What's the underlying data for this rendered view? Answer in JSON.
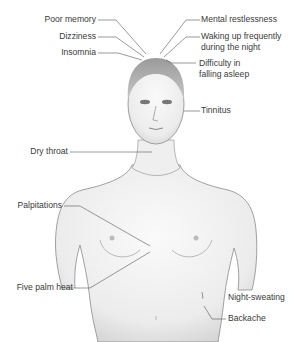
{
  "diagram": {
    "labels_left": [
      {
        "id": "poor-memory",
        "text": "Poor memory"
      },
      {
        "id": "dizziness",
        "text": "Dizziness"
      },
      {
        "id": "insomnia",
        "text": "Insomnia"
      },
      {
        "id": "dry-throat",
        "text": "Dry throat"
      },
      {
        "id": "palpitations",
        "text": "Palpitations"
      },
      {
        "id": "five-palm-heat",
        "text": "Five palm heat"
      }
    ],
    "labels_right": [
      {
        "id": "mental-restlessness",
        "text": "Mental restlessness"
      },
      {
        "id": "waking-up",
        "line1": "Waking up frequently",
        "line2": "during the night"
      },
      {
        "id": "difficulty-asleep",
        "line1": "Difficulty in",
        "line2": "falling asleep"
      },
      {
        "id": "tinnitus",
        "text": "Tinnitus"
      },
      {
        "id": "night-sweating",
        "text": "Night-sweating"
      },
      {
        "id": "backache",
        "text": "Backache"
      }
    ],
    "colors": {
      "skin_light": "#f2f2f2",
      "skin_shade": "#cfcfcf",
      "outline": "#8a8a8a",
      "leader": "#555555",
      "text": "#3a3a3a"
    }
  }
}
